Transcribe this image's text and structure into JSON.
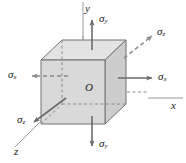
{
  "figure": {
    "type": "stress-element-3d",
    "colors": {
      "face_front": "#d6d6d6",
      "face_right": "#cfcfcf",
      "face_top": "#e2e2e2",
      "edge": "#6e6e6e",
      "hidden_edge": "#8c8c8c",
      "arrow": "#6b6b6b",
      "axis": "#8a8a8a",
      "text": "#1a1a1a"
    }
  },
  "axes": {
    "y": {
      "label": "y"
    },
    "x": {
      "label": "x"
    },
    "z": {
      "label": "z"
    }
  },
  "origin": {
    "label": "O"
  },
  "stresses": [
    {
      "id": "sigma-y-top",
      "symbol": "σ",
      "sub": "y",
      "direction": "up",
      "style": "solid"
    },
    {
      "id": "sigma-y-bottom",
      "symbol": "σ",
      "sub": "y",
      "direction": "down",
      "style": "solid"
    },
    {
      "id": "sigma-x-right",
      "symbol": "σ",
      "sub": "x",
      "direction": "right",
      "style": "solid"
    },
    {
      "id": "sigma-x-left",
      "symbol": "σ",
      "sub": "x",
      "direction": "left",
      "style": "dashed"
    },
    {
      "id": "sigma-z-upper",
      "symbol": "σ",
      "sub": "z",
      "direction": "up-right",
      "style": "dashed"
    },
    {
      "id": "sigma-z-lower",
      "symbol": "σ",
      "sub": "z",
      "direction": "down-left",
      "style": "solid"
    }
  ]
}
